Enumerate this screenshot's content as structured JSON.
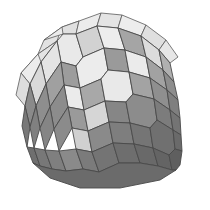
{
  "figure": {
    "name": "rhombic-zonohedron",
    "title": "Rhombic zonohedron",
    "background_color": "#ffffff",
    "edge_color": "#4a4a4a",
    "canvas": {
      "width": 210,
      "height": 210
    },
    "shading": {
      "light": "#e8e8e8",
      "light_alt": "#dcdcdc",
      "medium": "#b4b4b4",
      "medium_alt": "#a8a8a8",
      "dark": "#8c8c8c",
      "dark_alt": "#7e7e7e",
      "darkest": "#6e6e6e"
    },
    "faces": [
      {
        "id": "t-sliver-1",
        "shade": "#e2e2e2",
        "cls": "sliver",
        "points": "38,54 44,40 62,27 57,41"
      },
      {
        "id": "t-sliver-2",
        "shade": "#ebebeb",
        "cls": "sliver",
        "points": "44,40 62,27 79,21 63,34"
      },
      {
        "id": "t-sliver-3",
        "shade": "#e0e0e0",
        "cls": "sliver",
        "points": "62,27 79,21 76,34 63,34"
      },
      {
        "id": "t-sliver-4",
        "shade": "#ececec",
        "cls": "sliver",
        "points": "79,21 101,13 97,26 76,34"
      },
      {
        "id": "t-sliver-5",
        "shade": "#e4e4e4",
        "cls": "sliver",
        "points": "101,13 122,15 118,28 97,26"
      },
      {
        "id": "t-sliver-6",
        "shade": "#ededed",
        "cls": "sliver",
        "points": "122,15 146,25 141,36 118,28"
      },
      {
        "id": "t-sliver-7",
        "shade": "#dfdfdf",
        "cls": "sliver",
        "points": "146,25 166,40 159,50 141,36"
      },
      {
        "id": "t-sliver-8",
        "shade": "#e6e6e6",
        "cls": "sliver",
        "points": "166,40 178,57 170,63 159,50"
      },
      {
        "id": "l-sliver-1",
        "shade": "#e3e3e3",
        "cls": "sliver",
        "points": "21,73 38,54 57,41 41,62"
      },
      {
        "id": "l-sliver-2",
        "shade": "#ececec",
        "cls": "sliver",
        "points": "38,54 41,62 30,84 21,73"
      },
      {
        "id": "l-sliver-3",
        "shade": "#dddddd",
        "cls": "sliver",
        "points": "21,73 30,84 25,106 16,95"
      },
      {
        "id": "f-top-1",
        "shade": "#e9e9e9",
        "points": "57,41 63,34 76,34 83,57 76,66 61,62"
      },
      {
        "id": "f-top-2",
        "shade": "#d2d2d2",
        "points": "76,34 97,26 104,48 83,57"
      },
      {
        "id": "f-top-3",
        "shade": "#ededed",
        "points": "97,26 118,28 125,50 104,48"
      },
      {
        "id": "f-top-4",
        "shade": "#a5a5a5",
        "points": "118,28 141,36 146,57 125,50"
      },
      {
        "id": "f-top-5",
        "shade": "#dcdcdc",
        "points": "141,36 159,50 163,70 146,57"
      },
      {
        "id": "f-top-6",
        "shade": "#b0b0b0",
        "points": "159,50 170,63 174,82 163,70"
      },
      {
        "id": "f-r2-1",
        "shade": "#e4e4e4",
        "points": "41,62 57,41 61,62 46,84"
      },
      {
        "id": "f-r2-2",
        "shade": "#9c9c9c",
        "points": "61,62 76,66 80,88 64,85"
      },
      {
        "id": "f-r2-3",
        "shade": "#ececec",
        "points": "76,66 83,57 104,48 108,70 101,79 80,88"
      },
      {
        "id": "f-r2-4",
        "shade": "#9a9a9a",
        "points": "104,48 125,50 129,72 108,70"
      },
      {
        "id": "f-r2-5",
        "shade": "#ebebeb",
        "points": "125,50 146,57 150,78 129,72"
      },
      {
        "id": "f-r2-6",
        "shade": "#a2a2a2",
        "points": "146,57 163,70 167,90 150,78"
      },
      {
        "id": "f-r2-7",
        "shade": "#8d8d8d",
        "points": "163,70 174,82 178,100 167,90"
      },
      {
        "id": "f-r3-1",
        "shade": "#d9d9d9",
        "points": "30,84 41,62 46,84 36,106"
      },
      {
        "id": "f-r3-2",
        "shade": "#a0a0a0",
        "points": "46,84 61,62 64,85 50,107"
      },
      {
        "id": "f-r3-3",
        "shade": "#ebebeb",
        "points": "64,85 80,88 84,110 68,107"
      },
      {
        "id": "f-r3-4",
        "shade": "#a8a8a8",
        "points": "80,88 101,79 105,101 84,110"
      },
      {
        "id": "f-r3-5",
        "shade": "#e9e9e9",
        "points": "101,79 108,70 129,72 133,94 126,102 105,101"
      },
      {
        "id": "f-r3-6",
        "shade": "#a3a3a3",
        "points": "129,72 150,78 154,99 133,94"
      },
      {
        "id": "f-r3-7",
        "shade": "#8f8f8f",
        "points": "150,78 167,90 170,110 154,99"
      },
      {
        "id": "f-r3-8",
        "shade": "#7f7f7f",
        "points": "167,90 178,100 180,118 170,110"
      },
      {
        "id": "f-r4-1",
        "shade": "#8a8a8a",
        "points": "25,106 30,84 36,106 30,127"
      },
      {
        "id": "f-r4-2",
        "shade": "#8e8e8e",
        "points": "36,106 46,84 50,107 40,128"
      },
      {
        "id": "f-r4-3",
        "shade": "#8c8c8c",
        "points": "50,107 64,85 68,107 54,129"
      },
      {
        "id": "f-r4-4",
        "shade": "#9a9a9a",
        "points": "68,107 84,110 88,131 72,128"
      },
      {
        "id": "f-r4-5",
        "shade": "#d6d6d6",
        "points": "84,110 105,101 109,122 88,131"
      },
      {
        "id": "f-r4-6",
        "shade": "#868686",
        "points": "105,101 126,102 130,123 109,122"
      },
      {
        "id": "f-r4-7",
        "shade": "#8c8c8c",
        "points": "126,102 133,94 154,99 157,120 150,128 130,123"
      },
      {
        "id": "f-r4-8",
        "shade": "#7c7c7c",
        "points": "154,99 170,110 173,130 157,120"
      },
      {
        "id": "f-r4-9",
        "shade": "#747474",
        "points": "170,110 180,118 181,135 173,130"
      },
      {
        "id": "f-r5-1",
        "shade": "#787878",
        "points": "22,126 25,106 30,127 27,147"
      },
      {
        "id": "f-r5-2",
        "shade": "#808080",
        "points": "30,127 36,106 40,128 34,148"
      },
      {
        "id": "f-r5-3",
        "shade": "#858585",
        "points": "40,128 50,107 54,129 45,150"
      },
      {
        "id": "f-r5-4",
        "shade": "#8b8b8b",
        "points": "54,129 68,107 72,128 59,151"
      },
      {
        "id": "f-r5-5",
        "shade": "#d0d0d0",
        "points": "72,128 88,131 92,152 76,149"
      },
      {
        "id": "f-r5-6",
        "shade": "#8a8a8a",
        "points": "88,131 109,122 113,143 92,152"
      },
      {
        "id": "f-r5-7",
        "shade": "#7e7e7e",
        "points": "109,122 130,123 134,144 113,143"
      },
      {
        "id": "f-r5-8",
        "shade": "#757575",
        "points": "130,123 150,128 153,148 134,144"
      },
      {
        "id": "f-r5-9",
        "shade": "#707070",
        "points": "150,128 157,120 173,130 175,149 169,155 153,148"
      },
      {
        "id": "f-r5-10",
        "shade": "#6a6a6a",
        "points": "173,130 181,135 182,151 175,149"
      },
      {
        "id": "f-r6-1",
        "shade": "#6f6f6f",
        "points": "27,147 34,148 40,166 33,163"
      },
      {
        "id": "f-r6-2",
        "shade": "#787878",
        "points": "34,148 45,150 52,169 40,166"
      },
      {
        "id": "f-r6-3",
        "shade": "#7f7f7f",
        "points": "45,150 59,151 66,171 52,169"
      },
      {
        "id": "f-r6-4",
        "shade": "#8a8a8a",
        "points": "59,151 76,149 83,169 66,171"
      },
      {
        "id": "f-r6-5",
        "shade": "#7b7b7b",
        "points": "76,149 92,152 99,172 83,169"
      },
      {
        "id": "f-r6-6",
        "shade": "#747474",
        "points": "92,152 113,143 119,163 99,172"
      },
      {
        "id": "f-r6-7",
        "shade": "#6e6e6e",
        "points": "113,143 134,144 140,163 119,163"
      },
      {
        "id": "f-r6-8",
        "shade": "#696969",
        "points": "134,144 153,148 158,166 140,163"
      },
      {
        "id": "f-r6-9",
        "shade": "#646464",
        "points": "153,148 169,155 172,170 158,166"
      },
      {
        "id": "f-r6-10",
        "shade": "#5f5f5f",
        "points": "169,155 175,149 182,151 180,165 176,170 172,170"
      },
      {
        "id": "f-b-1",
        "shade": "#6b6b6b",
        "points": "33,163 40,166 52,169 66,171 83,169 99,172 119,163 140,163 158,166 172,170 176,170 160,180 120,188 80,188 50,178"
      }
    ]
  }
}
